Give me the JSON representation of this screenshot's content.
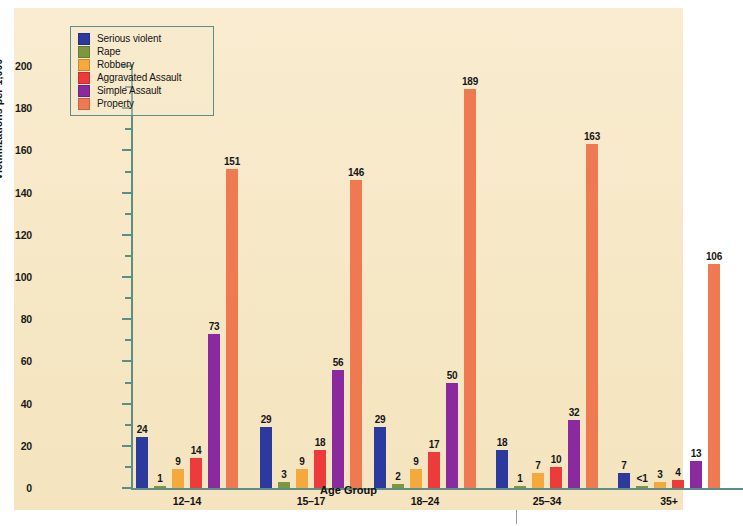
{
  "figure": {
    "background_color": "#f7e9c8",
    "axis_color": "#5b8f86"
  },
  "chart_data": {
    "type": "bar",
    "title": "",
    "xlabel": "Age Group",
    "ylabel": "Victimizations per 1,000",
    "ylim": [
      0,
      200
    ],
    "ytick_step": 20,
    "yminor_step": 10,
    "grid": false,
    "legend_position": "top-left",
    "ytick_labels": [
      "0",
      "20",
      "40",
      "60",
      "80",
      "100",
      "120",
      "140",
      "160",
      "180",
      "200"
    ],
    "categories": [
      "12–14",
      "15–17",
      "18–24",
      "25–34",
      "35+"
    ],
    "series": [
      {
        "name": "Serious violent",
        "color": "#2b3a9c",
        "values": [
          24,
          29,
          29,
          18,
          7
        ],
        "labels": [
          "24",
          "29",
          "29",
          "18",
          "7"
        ]
      },
      {
        "name": "Rape",
        "color": "#7d9640",
        "values": [
          1,
          3,
          2,
          1,
          0.5
        ],
        "labels": [
          "1",
          "3",
          "2",
          "1",
          "<1"
        ]
      },
      {
        "name": "Robbery",
        "color": "#f5a83c",
        "values": [
          9,
          9,
          9,
          7,
          3
        ],
        "labels": [
          "9",
          "9",
          "9",
          "7",
          "3"
        ]
      },
      {
        "name": "Aggravated Assault",
        "color": "#ed3b3b",
        "values": [
          14,
          18,
          17,
          10,
          4
        ],
        "labels": [
          "14",
          "18",
          "17",
          "10",
          "4"
        ]
      },
      {
        "name": "Simple Assault",
        "color": "#8b2a9e",
        "values": [
          73,
          56,
          50,
          32,
          13
        ],
        "labels": [
          "73",
          "56",
          "50",
          "32",
          "13"
        ]
      },
      {
        "name": "Property",
        "color": "#ef7a52",
        "values": [
          151,
          146,
          189,
          163,
          106
        ],
        "labels": [
          "151",
          "146",
          "189",
          "163",
          "106"
        ]
      }
    ]
  }
}
